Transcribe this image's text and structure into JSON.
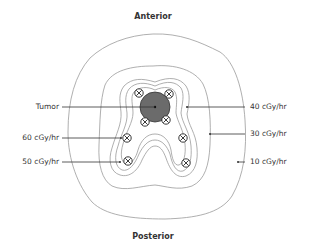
{
  "diagram": {
    "orientation": {
      "top": "Anterior",
      "bottom": "Posterior"
    },
    "labels_left": [
      {
        "text": "Tumor",
        "target": "tumor"
      },
      {
        "text": "60 cGy/hr",
        "target": "isodose-60"
      },
      {
        "text": "50 cGy/hr",
        "target": "isodose-50"
      }
    ],
    "labels_right": [
      {
        "text": "40 cGy/hr",
        "target": "isodose-40"
      },
      {
        "text": "30 cGy/hr",
        "target": "isodose-30"
      },
      {
        "text": "10 cGy/hr",
        "target": "isodose-10"
      }
    ],
    "tumor": {
      "fill": "#6b6b6b",
      "radius": 15
    },
    "seed_count": 8,
    "seed_icon": "circled-x-icon",
    "colors": {
      "contour": "#9a9a9a",
      "leader": "#333333",
      "text": "#333333"
    }
  }
}
